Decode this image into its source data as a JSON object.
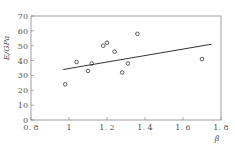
{
  "chart_data": {
    "type": "scatter",
    "title": "",
    "xlabel": "β",
    "ylabel": "E/GPa",
    "xlim": [
      0.8,
      1.8
    ],
    "ylim": [
      0,
      70
    ],
    "x_ticks": [
      "0.8",
      "1",
      "1.2",
      "1.4",
      "1.6",
      "1.8"
    ],
    "y_ticks": [
      "0",
      "10",
      "20",
      "30",
      "40",
      "50",
      "60",
      "70"
    ],
    "grid": false,
    "legend": null,
    "series": [
      {
        "name": "measured",
        "marker": "open-circle",
        "points": [
          {
            "x": 0.98,
            "y": 24
          },
          {
            "x": 1.04,
            "y": 39
          },
          {
            "x": 1.1,
            "y": 33
          },
          {
            "x": 1.12,
            "y": 38
          },
          {
            "x": 1.18,
            "y": 50
          },
          {
            "x": 1.2,
            "y": 52
          },
          {
            "x": 1.24,
            "y": 46
          },
          {
            "x": 1.28,
            "y": 32
          },
          {
            "x": 1.31,
            "y": 38
          },
          {
            "x": 1.36,
            "y": 58
          },
          {
            "x": 1.7,
            "y": 41
          }
        ]
      },
      {
        "name": "fit",
        "type": "line",
        "points": [
          {
            "x": 0.97,
            "y": 34
          },
          {
            "x": 1.75,
            "y": 51
          }
        ]
      }
    ]
  }
}
